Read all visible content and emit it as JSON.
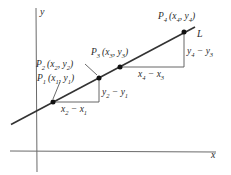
{
  "diagram": {
    "type": "slope-of-line",
    "axes": {
      "x_label": "x",
      "y_label": "y"
    },
    "line": {
      "label": "L"
    },
    "points": [
      {
        "name": "P",
        "sub": "1",
        "coords": "(x",
        "xsub": "1",
        "ysep": ", y",
        "ysub": "1",
        "close": ")"
      },
      {
        "name": "P",
        "sub": "2",
        "coords": "(x",
        "xsub": "2",
        "ysep": ", y",
        "ysub": "2",
        "close": ")"
      },
      {
        "name": "P",
        "sub": "3",
        "coords": "(x",
        "xsub": "3",
        "ysep": ", y",
        "ysub": "3",
        "close": ")"
      },
      {
        "name": "P",
        "sub": "4",
        "coords": "(x",
        "xsub": "4",
        "ysep": ", y",
        "ysub": "4",
        "close": ")"
      }
    ],
    "differences": {
      "run_1": {
        "a": "x",
        "a_sub": "2",
        "op": " − ",
        "b": "x",
        "b_sub": "1"
      },
      "rise_1": {
        "a": "y",
        "a_sub": "2",
        "op": " − ",
        "b": "y",
        "b_sub": "1"
      },
      "run_2": {
        "a": "x",
        "a_sub": "4",
        "op": " − ",
        "b": "x",
        "b_sub": "3"
      },
      "rise_2": {
        "a": "y",
        "a_sub": "4",
        "op": " − ",
        "b": "y",
        "b_sub": "3"
      }
    },
    "colors": {
      "background": "#ffffff",
      "ink": "#2a2a2a",
      "axis": "#6a6a6a"
    }
  }
}
